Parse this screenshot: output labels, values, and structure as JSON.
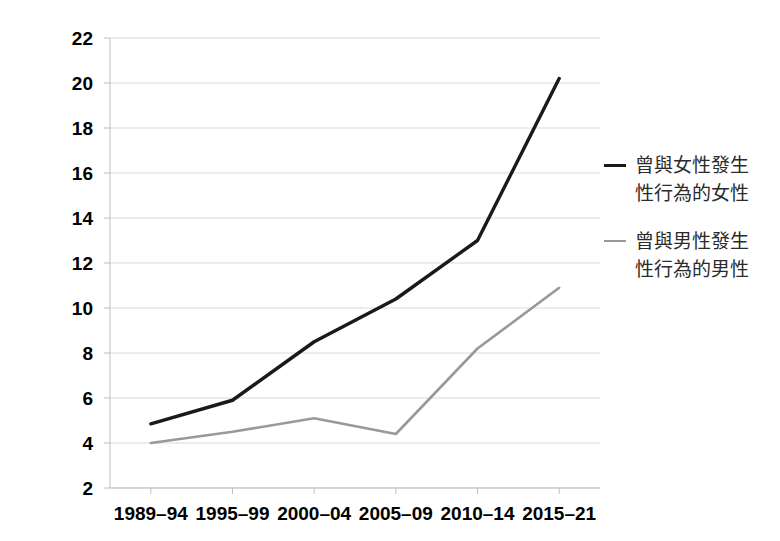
{
  "chart_data": {
    "type": "line",
    "title": "",
    "xlabel": "",
    "ylabel": "",
    "categories": [
      "1989–94",
      "1995–99",
      "2000–04",
      "2005–09",
      "2010–14",
      "2015–21"
    ],
    "ylim": [
      2,
      22
    ],
    "yticks": [
      2,
      4,
      6,
      8,
      10,
      12,
      14,
      16,
      18,
      20,
      22
    ],
    "ytick_labels": [
      "2",
      "4",
      "6",
      "8",
      "10",
      "12",
      "14",
      "16",
      "18",
      "20",
      "22"
    ],
    "grid": "horizontal",
    "legend_position": "right",
    "series": [
      {
        "name": "曾與女性發生性行為的女性",
        "name_line1": "曾與女性發生",
        "name_line2": "性行為的女性",
        "color": "#1a1a1a",
        "values": [
          4.85,
          5.9,
          8.5,
          10.4,
          13.0,
          20.2
        ]
      },
      {
        "name": "曾與男性發生性行為的男性",
        "name_line1": "曾與男性發生",
        "name_line2": "性行為的男性",
        "color": "#999999",
        "values": [
          4.0,
          4.5,
          5.1,
          4.4,
          8.2,
          10.9
        ]
      }
    ]
  },
  "axes": {
    "grid_color": "#d9d9d9",
    "axis_color": "#bfbfbf"
  }
}
